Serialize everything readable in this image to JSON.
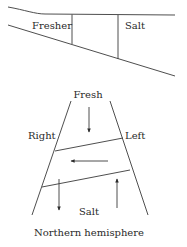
{
  "estuary_cross_section": {
    "labels": {
      "fresher": "Fresher",
      "salt": "Salt"
    }
  },
  "estuary_plan_view": {
    "labels": {
      "fresh": "Fresh",
      "right": "Right",
      "left": "Left",
      "salt": "Salt"
    },
    "arrows": [
      {
        "name": "fresh-inflow",
        "direction": "down"
      },
      {
        "name": "cross-flow",
        "direction": "left"
      },
      {
        "name": "outflow-right-bank",
        "direction": "down"
      },
      {
        "name": "inflow-left-bank",
        "direction": "up"
      }
    ],
    "caption": "Northern hemisphere"
  }
}
